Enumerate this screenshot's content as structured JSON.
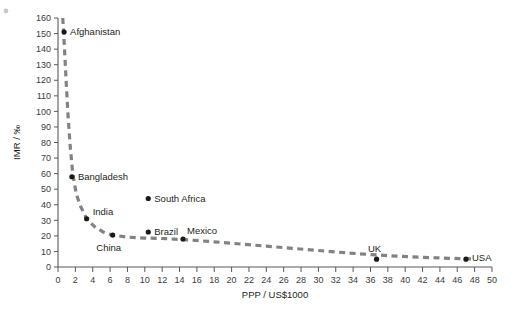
{
  "chart_data": {
    "type": "scatter",
    "title": "",
    "subtitle": "",
    "xlabel": "PPP / US$1000",
    "ylabel": "IMR / ‰",
    "xlim": [
      0,
      50
    ],
    "ylim": [
      0,
      160
    ],
    "xticks": [
      0,
      2,
      4,
      6,
      8,
      10,
      12,
      14,
      16,
      18,
      20,
      22,
      24,
      26,
      28,
      30,
      32,
      34,
      36,
      38,
      40,
      42,
      44,
      46,
      48,
      50
    ],
    "yticks": [
      0,
      10,
      20,
      30,
      40,
      50,
      60,
      70,
      80,
      90,
      100,
      110,
      120,
      130,
      140,
      150,
      160
    ],
    "grid": false,
    "legend": "none",
    "points": [
      {
        "label": "Afghanistan",
        "x": 0.7,
        "y": 151,
        "label_dx": 6,
        "label_dy": 3
      },
      {
        "label": "Bangladesh",
        "x": 1.6,
        "y": 58,
        "label_dx": 6,
        "label_dy": 3
      },
      {
        "label": "India",
        "x": 3.3,
        "y": 31,
        "label_dx": 6,
        "label_dy": -4
      },
      {
        "label": "China",
        "x": 6.3,
        "y": 20.5,
        "label_dx": -4,
        "label_dy": 16
      },
      {
        "label": "South Africa",
        "x": 10.4,
        "y": 44,
        "label_dx": 6,
        "label_dy": 3
      },
      {
        "label": "Brazil",
        "x": 10.4,
        "y": 22.5,
        "label_dx": 6,
        "label_dy": 3
      },
      {
        "label": "Mexico",
        "x": 14.4,
        "y": 18,
        "label_dx": 4,
        "label_dy": -5
      },
      {
        "label": "UK",
        "x": 36.7,
        "y": 5,
        "label_dx": -2,
        "label_dy": -7
      },
      {
        "label": "USA",
        "x": 47.0,
        "y": 5,
        "label_dx": 6,
        "label_dy": 2
      }
    ],
    "trend_curve": [
      {
        "x": 0.55,
        "y": 160
      },
      {
        "x": 0.75,
        "y": 140
      },
      {
        "x": 0.95,
        "y": 118
      },
      {
        "x": 1.15,
        "y": 98
      },
      {
        "x": 1.4,
        "y": 78
      },
      {
        "x": 1.7,
        "y": 60
      },
      {
        "x": 2.1,
        "y": 47
      },
      {
        "x": 2.6,
        "y": 39
      },
      {
        "x": 3.3,
        "y": 31
      },
      {
        "x": 4.2,
        "y": 26
      },
      {
        "x": 5.2,
        "y": 22.5
      },
      {
        "x": 6.3,
        "y": 20.5
      },
      {
        "x": 8.0,
        "y": 19.2
      },
      {
        "x": 10.0,
        "y": 18.6
      },
      {
        "x": 12.5,
        "y": 18.2
      },
      {
        "x": 15.0,
        "y": 17.4
      },
      {
        "x": 18.0,
        "y": 16.2
      },
      {
        "x": 21.0,
        "y": 14.8
      },
      {
        "x": 24.0,
        "y": 13.4
      },
      {
        "x": 27.0,
        "y": 12.0
      },
      {
        "x": 30.0,
        "y": 10.6
      },
      {
        "x": 33.0,
        "y": 9.2
      },
      {
        "x": 36.0,
        "y": 8.0
      },
      {
        "x": 39.0,
        "y": 7.0
      },
      {
        "x": 42.0,
        "y": 6.2
      },
      {
        "x": 45.0,
        "y": 5.6
      },
      {
        "x": 48.0,
        "y": 5.2
      }
    ],
    "colors": {
      "curve": "#808285",
      "point": "#1a1a1a",
      "axis": "#58595b",
      "text": "#231f20",
      "tick_text": "#3b3b3b",
      "background": "#ffffff"
    }
  }
}
